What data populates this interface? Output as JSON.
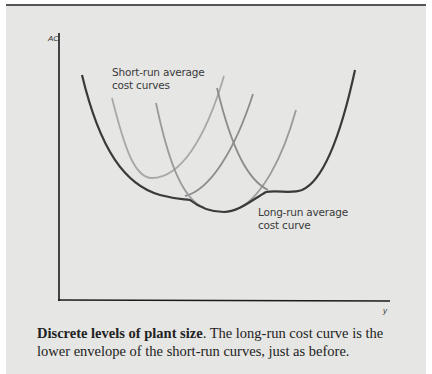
{
  "figure": {
    "y_axis_label": "AC",
    "x_axis_label": "y",
    "annotations": {
      "short_run": "Short-run average\ncost curves",
      "long_run": "Long-run average\ncost curve"
    },
    "colors": {
      "background": "#e6e6e4",
      "axis": "#1a1a1a",
      "envelope": "#3a3a3a",
      "srac_mid": "#8c8c8c",
      "srac_light": "#a8a8a8"
    },
    "curves": [
      {
        "name": "SRAC 1",
        "min_x": 172,
        "min_y": 198
      },
      {
        "name": "SRAC 2",
        "min_x": 150,
        "min_y": 178
      },
      {
        "name": "SRAC 3",
        "min_x": 222,
        "min_y": 212
      },
      {
        "name": "SRAC 4",
        "min_x": 285,
        "min_y": 193
      }
    ]
  },
  "caption": {
    "bold": "Discrete levels of plant size",
    "text": ".  The long-run cost curve is the lower envelope of the short-run curves, just as before."
  }
}
